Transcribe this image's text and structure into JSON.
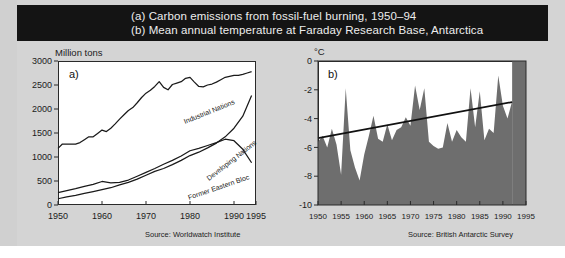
{
  "title_bar": {
    "line_a": "(a) Carbon emissions from fossil-fuel burning, 1950–94",
    "line_b": "(b) Mean annual temperature at Faraday Research Base, Antarctica",
    "background": "#141414",
    "text_color": "#ededed"
  },
  "page": {
    "background": "#d4d4d4"
  },
  "chart_data": [
    {
      "id": "a",
      "type": "line",
      "panel_letter": "a)",
      "title": "Carbon emissions from fossil-fuel burning, 1950–94",
      "xlabel": "",
      "ylabel": "Million tons",
      "ylim": [
        0,
        3000
      ],
      "xlim": [
        1950,
        1995
      ],
      "yticks": [
        0,
        500,
        1000,
        1500,
        2000,
        2500,
        3000
      ],
      "ytick_labels": [
        "0",
        "500",
        "1000",
        "1500",
        "2000",
        "2500",
        "3000"
      ],
      "xticks": [
        1950,
        1960,
        1970,
        1980,
        1990,
        1995
      ],
      "xtick_labels": [
        "1950",
        "1960",
        "1970",
        "1980",
        "1990",
        "1995"
      ],
      "grid": false,
      "legend": "inline-labels",
      "source": "Source: Worldwatch Institute",
      "series": [
        {
          "name": "Industrial Nations",
          "color": "#1a1a1a",
          "x": [
            1950,
            1951,
            1952,
            1953,
            1954,
            1955,
            1956,
            1957,
            1958,
            1959,
            1960,
            1961,
            1962,
            1963,
            1964,
            1965,
            1966,
            1967,
            1968,
            1969,
            1970,
            1971,
            1972,
            1973,
            1974,
            1975,
            1976,
            1977,
            1978,
            1979,
            1980,
            1981,
            1982,
            1983,
            1984,
            1985,
            1986,
            1987,
            1988,
            1989,
            1990,
            1991,
            1992,
            1993,
            1994
          ],
          "values": [
            1180,
            1270,
            1270,
            1270,
            1270,
            1300,
            1360,
            1420,
            1420,
            1490,
            1560,
            1530,
            1600,
            1690,
            1790,
            1880,
            1970,
            2030,
            2130,
            2240,
            2330,
            2390,
            2470,
            2570,
            2450,
            2400,
            2510,
            2540,
            2570,
            2640,
            2660,
            2560,
            2470,
            2460,
            2500,
            2520,
            2560,
            2610,
            2660,
            2680,
            2700,
            2700,
            2720,
            2750,
            2780
          ]
        },
        {
          "name": "Developing Nations",
          "color": "#1a1a1a",
          "x": [
            1950,
            1952,
            1954,
            1956,
            1958,
            1960,
            1962,
            1964,
            1966,
            1968,
            1970,
            1972,
            1974,
            1976,
            1978,
            1980,
            1982,
            1984,
            1986,
            1988,
            1990,
            1992,
            1994
          ],
          "values": [
            130,
            170,
            200,
            240,
            280,
            320,
            360,
            420,
            470,
            540,
            620,
            700,
            760,
            840,
            930,
            1030,
            1100,
            1190,
            1290,
            1420,
            1600,
            1850,
            2280
          ]
        },
        {
          "name": "Former Eastern Bloc",
          "color": "#1a1a1a",
          "x": [
            1950,
            1952,
            1954,
            1956,
            1958,
            1960,
            1962,
            1964,
            1966,
            1968,
            1970,
            1972,
            1974,
            1976,
            1978,
            1980,
            1982,
            1984,
            1986,
            1988,
            1990,
            1992,
            1994
          ],
          "values": [
            260,
            300,
            340,
            390,
            430,
            490,
            460,
            470,
            520,
            600,
            680,
            760,
            850,
            930,
            1020,
            1130,
            1180,
            1240,
            1300,
            1370,
            1340,
            1160,
            880
          ]
        }
      ]
    },
    {
      "id": "b",
      "type": "area",
      "panel_letter": "b)",
      "title": "Mean annual temperature at Faraday Research Base, Antarctica",
      "xlabel": "",
      "ylabel": "°C",
      "ylim": [
        -10,
        0
      ],
      "xlim": [
        1950,
        1995
      ],
      "yticks": [
        0,
        -2,
        -4,
        -6,
        -8,
        -10
      ],
      "ytick_labels": [
        "0",
        "-2",
        "-4",
        "-6",
        "-8",
        "-10"
      ],
      "xticks": [
        1950,
        1955,
        1960,
        1965,
        1970,
        1975,
        1980,
        1985,
        1990,
        1995
      ],
      "xtick_labels": [
        "1950",
        "1955",
        "1960",
        "1965",
        "1970",
        "1975",
        "1980",
        "1985",
        "1990",
        "1995"
      ],
      "grid": false,
      "fill_color": "#6e6e6e",
      "source": "Source: British Antarctic Survey",
      "series": [
        {
          "name": "Mean annual temperature",
          "x": [
            1950,
            1951,
            1952,
            1953,
            1954,
            1955,
            1956,
            1957,
            1958,
            1959,
            1960,
            1961,
            1962,
            1963,
            1964,
            1965,
            1966,
            1967,
            1968,
            1969,
            1970,
            1971,
            1972,
            1973,
            1974,
            1975,
            1976,
            1977,
            1978,
            1979,
            1980,
            1981,
            1982,
            1983,
            1984,
            1985,
            1986,
            1987,
            1988,
            1989,
            1990,
            1991,
            1992
          ],
          "values": [
            -5.6,
            -5.2,
            -6.0,
            -4.7,
            -5.8,
            -7.9,
            -1.9,
            -6.2,
            -7.4,
            -8.3,
            -6.5,
            -5.2,
            -3.8,
            -5.4,
            -5.6,
            -4.4,
            -5.5,
            -4.8,
            -4.6,
            -3.9,
            -4.5,
            -1.7,
            -3.4,
            -1.9,
            -5.6,
            -5.9,
            -6.1,
            -6.0,
            -4.3,
            -5.6,
            -4.8,
            -5.3,
            -5.6,
            -1.9,
            -4.6,
            -2.1,
            -5.5,
            -4.7,
            -5.0,
            -1.0,
            -3.1,
            -4.0,
            -2.8
          ]
        }
      ],
      "trend_line": {
        "name": "linear trend",
        "x": [
          1950,
          1992
        ],
        "values": [
          -5.35,
          -2.85
        ],
        "color": "#111111"
      }
    }
  ]
}
